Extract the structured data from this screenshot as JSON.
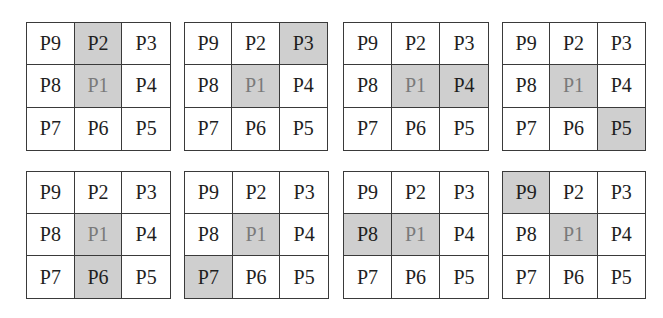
{
  "figure": {
    "highlight_color": "#cfcfcf",
    "center_text_color": "#7a7a7a",
    "text_color": "#1e1e1e",
    "layout": [
      [
        "P9",
        "P2",
        "P3"
      ],
      [
        "P8",
        "P1",
        "P4"
      ],
      [
        "P7",
        "P6",
        "P5"
      ]
    ],
    "grids": [
      {
        "highlighted_neighbor": "P2",
        "cells": [
          "P9",
          "P2",
          "P3",
          "P8",
          "P1",
          "P4",
          "P7",
          "P6",
          "P5"
        ]
      },
      {
        "highlighted_neighbor": "P3",
        "cells": [
          "P9",
          "P2",
          "P3",
          "P8",
          "P1",
          "P4",
          "P7",
          "P6",
          "P5"
        ]
      },
      {
        "highlighted_neighbor": "P4",
        "cells": [
          "P9",
          "P2",
          "P3",
          "P8",
          "P1",
          "P4",
          "P7",
          "P6",
          "P5"
        ]
      },
      {
        "highlighted_neighbor": "P5",
        "cells": [
          "P9",
          "P2",
          "P3",
          "P8",
          "P1",
          "P4",
          "P7",
          "P6",
          "P5"
        ]
      },
      {
        "highlighted_neighbor": "P6",
        "cells": [
          "P9",
          "P2",
          "P3",
          "P8",
          "P1",
          "P4",
          "P7",
          "P6",
          "P5"
        ]
      },
      {
        "highlighted_neighbor": "P7",
        "cells": [
          "P9",
          "P2",
          "P3",
          "P8",
          "P1",
          "P4",
          "P7",
          "P6",
          "P5"
        ]
      },
      {
        "highlighted_neighbor": "P8",
        "cells": [
          "P9",
          "P2",
          "P3",
          "P8",
          "P1",
          "P4",
          "P7",
          "P6",
          "P5"
        ]
      },
      {
        "highlighted_neighbor": "P9",
        "cells": [
          "P9",
          "P2",
          "P3",
          "P8",
          "P1",
          "P4",
          "P7",
          "P6",
          "P5"
        ]
      }
    ]
  }
}
